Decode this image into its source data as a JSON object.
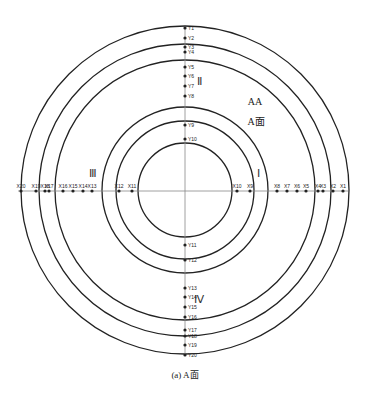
{
  "diagram": {
    "center": {
      "x": 185,
      "y": 190
    },
    "circles": [
      164,
      146,
      130,
      83,
      69,
      47
    ],
    "colors": {
      "line": "#222222",
      "axis": "#888888",
      "dot": "#222222"
    },
    "quadrant_labels": [
      {
        "text": "Ⅰ",
        "x": 258,
        "y": 177
      },
      {
        "text": "Ⅱ",
        "x": 199,
        "y": 85
      },
      {
        "text": "Ⅲ",
        "x": 93,
        "y": 177
      },
      {
        "text": "Ⅳ",
        "x": 199,
        "y": 303
      }
    ],
    "annotations": [
      {
        "text": "AA",
        "x": 255,
        "y": 105
      },
      {
        "text": "A面",
        "x": 256,
        "y": 125
      }
    ],
    "caption": "(a) A面",
    "y_points": [
      {
        "label": "Y1",
        "y": 28
      },
      {
        "label": "Y2",
        "y": 38
      },
      {
        "label": "Y3",
        "y": 47
      },
      {
        "label": "Y4",
        "y": 52
      },
      {
        "label": "Y5",
        "y": 67
      },
      {
        "label": "Y6",
        "y": 76
      },
      {
        "label": "Y7",
        "y": 86
      },
      {
        "label": "Y8",
        "y": 96
      },
      {
        "label": "Y9",
        "y": 125
      },
      {
        "label": "Y10",
        "y": 139
      },
      {
        "label": "Y11",
        "y": 245
      },
      {
        "label": "Y12",
        "y": 260
      },
      {
        "label": "Y13",
        "y": 288
      },
      {
        "label": "Y14",
        "y": 297
      },
      {
        "label": "Y15",
        "y": 307
      },
      {
        "label": "Y16",
        "y": 317
      },
      {
        "label": "Y17",
        "y": 330
      },
      {
        "label": "Y18",
        "y": 336
      },
      {
        "label": "Y19",
        "y": 345
      },
      {
        "label": "Y20",
        "y": 355
      }
    ],
    "x_points": [
      {
        "label": "X1",
        "x": 343
      },
      {
        "label": "X2",
        "x": 333
      },
      {
        "label": "X3",
        "x": 323
      },
      {
        "label": "X4",
        "x": 318
      },
      {
        "label": "X5",
        "x": 306
      },
      {
        "label": "X6",
        "x": 297
      },
      {
        "label": "X7",
        "x": 287
      },
      {
        "label": "X8",
        "x": 277
      },
      {
        "label": "X9",
        "x": 250
      },
      {
        "label": "X10",
        "x": 237
      },
      {
        "label": "X11",
        "x": 132
      },
      {
        "label": "X12",
        "x": 119
      },
      {
        "label": "X13",
        "x": 92
      },
      {
        "label": "X14",
        "x": 83
      },
      {
        "label": "X15",
        "x": 73
      },
      {
        "label": "X16",
        "x": 63
      },
      {
        "label": "X17",
        "x": 49
      },
      {
        "label": "X18",
        "x": 45
      },
      {
        "label": "X19",
        "x": 36
      },
      {
        "label": "X20",
        "x": 21
      }
    ]
  }
}
